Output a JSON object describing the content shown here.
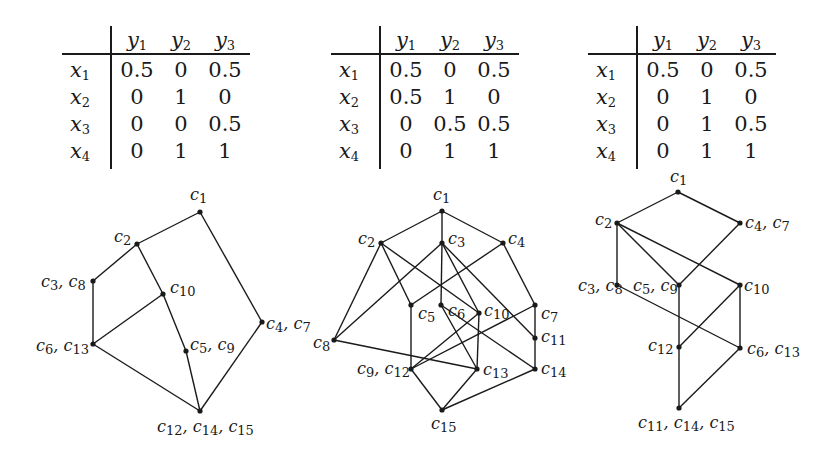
{
  "tables": [
    {
      "columns": [
        "y1",
        "y2",
        "y3"
      ],
      "rows": [
        {
          "label": "x1",
          "values": [
            "0.5",
            "0",
            "0.5"
          ]
        },
        {
          "label": "x2",
          "values": [
            "0",
            "1",
            "0"
          ]
        },
        {
          "label": "x3",
          "values": [
            "0",
            "0",
            "0.5"
          ]
        },
        {
          "label": "x4",
          "values": [
            "0",
            "1",
            "1"
          ]
        }
      ]
    },
    {
      "columns": [
        "y1",
        "y2",
        "y3"
      ],
      "rows": [
        {
          "label": "x1",
          "values": [
            "0.5",
            "0",
            "0.5"
          ]
        },
        {
          "label": "x2",
          "values": [
            "0.5",
            "1",
            "0"
          ]
        },
        {
          "label": "x3",
          "values": [
            "0",
            "0.5",
            "0.5"
          ]
        },
        {
          "label": "x4",
          "values": [
            "0",
            "1",
            "1"
          ]
        }
      ]
    },
    {
      "columns": [
        "y1",
        "y2",
        "y3"
      ],
      "rows": [
        {
          "label": "x1",
          "values": [
            "0.5",
            "0",
            "0.5"
          ]
        },
        {
          "label": "x2",
          "values": [
            "0",
            "1",
            "0"
          ]
        },
        {
          "label": "x3",
          "values": [
            "0",
            "1",
            "0.5"
          ]
        },
        {
          "label": "x4",
          "values": [
            "0",
            "1",
            "1"
          ]
        }
      ]
    }
  ],
  "graphs": [
    {
      "nodes": [
        {
          "id": "c1",
          "label": "c1",
          "x": 200,
          "y": 212
        },
        {
          "id": "c2",
          "label": "c2",
          "x": 137,
          "y": 244
        },
        {
          "id": "c3c8",
          "label": "c3, c8",
          "x": 93,
          "y": 281
        },
        {
          "id": "c10",
          "label": "c10",
          "x": 163,
          "y": 294
        },
        {
          "id": "c4c7",
          "label": "c4, c7",
          "x": 262,
          "y": 322
        },
        {
          "id": "c6c13",
          "label": "c6, c13",
          "x": 93,
          "y": 344
        },
        {
          "id": "c5c9",
          "label": "c5, c9",
          "x": 186,
          "y": 351
        },
        {
          "id": "c12c14c15",
          "label": "c12, c14, c15",
          "x": 200,
          "y": 411
        }
      ],
      "edges": [
        [
          "c1",
          "c2"
        ],
        [
          "c1",
          "c4c7"
        ],
        [
          "c2",
          "c3c8"
        ],
        [
          "c2",
          "c10"
        ],
        [
          "c3c8",
          "c6c13"
        ],
        [
          "c6c13",
          "c10"
        ],
        [
          "c10",
          "c5c9"
        ],
        [
          "c5c9",
          "c12c14c15"
        ],
        [
          "c6c13",
          "c12c14c15"
        ],
        [
          "c4c7",
          "c12c14c15"
        ]
      ]
    },
    {
      "nodes": [
        {
          "id": "c1",
          "label": "c1",
          "x": 442,
          "y": 211
        },
        {
          "id": "c2",
          "label": "c2",
          "x": 381,
          "y": 243
        },
        {
          "id": "c3",
          "label": "c3",
          "x": 442,
          "y": 243
        },
        {
          "id": "c4",
          "label": "c4",
          "x": 503,
          "y": 243
        },
        {
          "id": "c5",
          "label": "c5",
          "x": 411,
          "y": 305
        },
        {
          "id": "c6",
          "label": "c6",
          "x": 441,
          "y": 305
        },
        {
          "id": "c10",
          "label": "c10",
          "x": 479,
          "y": 313
        },
        {
          "id": "c7",
          "label": "c7",
          "x": 535,
          "y": 305
        },
        {
          "id": "c8",
          "label": "c8",
          "x": 334,
          "y": 340
        },
        {
          "id": "c11",
          "label": "c11",
          "x": 535,
          "y": 338
        },
        {
          "id": "c9c12",
          "label": "c9, c12",
          "x": 411,
          "y": 369
        },
        {
          "id": "c13",
          "label": "c13",
          "x": 477,
          "y": 369
        },
        {
          "id": "c14",
          "label": "c14",
          "x": 535,
          "y": 369
        },
        {
          "id": "c15",
          "label": "c15",
          "x": 442,
          "y": 410
        }
      ],
      "edges": [
        [
          "c1",
          "c2"
        ],
        [
          "c1",
          "c3"
        ],
        [
          "c1",
          "c4"
        ],
        [
          "c2",
          "c8"
        ],
        [
          "c2",
          "c5"
        ],
        [
          "c2",
          "c10"
        ],
        [
          "c3",
          "c8"
        ],
        [
          "c3",
          "c6"
        ],
        [
          "c3",
          "c10"
        ],
        [
          "c3",
          "c11"
        ],
        [
          "c4",
          "c5"
        ],
        [
          "c4",
          "c7"
        ],
        [
          "c5",
          "c9c12"
        ],
        [
          "c6",
          "c13"
        ],
        [
          "c6",
          "c14"
        ],
        [
          "c10",
          "c9c12"
        ],
        [
          "c10",
          "c13"
        ],
        [
          "c7",
          "c9c12"
        ],
        [
          "c7",
          "c11"
        ],
        [
          "c11",
          "c14"
        ],
        [
          "c8",
          "c13"
        ],
        [
          "c9c12",
          "c15"
        ],
        [
          "c13",
          "c15"
        ],
        [
          "c14",
          "c15"
        ]
      ]
    },
    {
      "nodes": [
        {
          "id": "c1",
          "label": "c1",
          "x": 678,
          "y": 192
        },
        {
          "id": "c2",
          "label": "c2",
          "x": 617,
          "y": 223
        },
        {
          "id": "c4c7",
          "label": "c4, c7",
          "x": 740,
          "y": 223
        },
        {
          "id": "c3c8",
          "label": "c3, c8",
          "x": 617,
          "y": 285
        },
        {
          "id": "c5c9",
          "label": "c5, c9",
          "x": 679,
          "y": 285
        },
        {
          "id": "c10",
          "label": "c10",
          "x": 740,
          "y": 285
        },
        {
          "id": "c12",
          "label": "c12",
          "x": 679,
          "y": 347
        },
        {
          "id": "c6c13",
          "label": "c6, c13",
          "x": 740,
          "y": 348
        },
        {
          "id": "c11c14c15",
          "label": "c11, c14, c15",
          "x": 679,
          "y": 408
        }
      ],
      "edges": [
        [
          "c1",
          "c2"
        ],
        [
          "c1",
          "c4c7"
        ],
        [
          "c2",
          "c3c8"
        ],
        [
          "c2",
          "c5c9"
        ],
        [
          "c2",
          "c10"
        ],
        [
          "c4c7",
          "c5c9"
        ],
        [
          "c3c8",
          "c6c13"
        ],
        [
          "c5c9",
          "c12"
        ],
        [
          "c10",
          "c12"
        ],
        [
          "c10",
          "c6c13"
        ],
        [
          "c12",
          "c11c14c15"
        ],
        [
          "c6c13",
          "c11c14c15"
        ]
      ]
    }
  ],
  "labels": [
    {
      "graph": 0,
      "text": "c1",
      "x": 190,
      "y": 186
    },
    {
      "graph": 0,
      "text": "c2",
      "x": 114,
      "y": 228
    },
    {
      "graph": 0,
      "text": "c3, c8",
      "x": 41,
      "y": 273
    },
    {
      "graph": 0,
      "text": "c10",
      "x": 170,
      "y": 279
    },
    {
      "graph": 0,
      "text": "c4, c7",
      "x": 266,
      "y": 315
    },
    {
      "graph": 0,
      "text": "c6, c13",
      "x": 36,
      "y": 337
    },
    {
      "graph": 0,
      "text": "c5, c9",
      "x": 190,
      "y": 336
    },
    {
      "graph": 0,
      "text": "c12, c14, c15",
      "x": 157,
      "y": 418
    },
    {
      "graph": 1,
      "text": "c1",
      "x": 433,
      "y": 186
    },
    {
      "graph": 1,
      "text": "c2",
      "x": 358,
      "y": 230
    },
    {
      "graph": 1,
      "text": "c3",
      "x": 448,
      "y": 230
    },
    {
      "graph": 1,
      "text": "c4",
      "x": 508,
      "y": 230
    },
    {
      "graph": 1,
      "text": "c5",
      "x": 418,
      "y": 305
    },
    {
      "graph": 1,
      "text": "c6",
      "x": 448,
      "y": 302
    },
    {
      "graph": 1,
      "text": "c10",
      "x": 484,
      "y": 302
    },
    {
      "graph": 1,
      "text": "c7",
      "x": 541,
      "y": 305
    },
    {
      "graph": 1,
      "text": "c8",
      "x": 313,
      "y": 334
    },
    {
      "graph": 1,
      "text": "c11",
      "x": 541,
      "y": 328
    },
    {
      "graph": 1,
      "text": "c9, c12",
      "x": 357,
      "y": 360
    },
    {
      "graph": 1,
      "text": "c13",
      "x": 483,
      "y": 361
    },
    {
      "graph": 1,
      "text": "c14",
      "x": 541,
      "y": 360
    },
    {
      "graph": 1,
      "text": "c15",
      "x": 431,
      "y": 415
    },
    {
      "graph": 2,
      "text": "c1",
      "x": 670,
      "y": 168
    },
    {
      "graph": 2,
      "text": "c2",
      "x": 595,
      "y": 211
    },
    {
      "graph": 2,
      "text": "c4, c7",
      "x": 745,
      "y": 214
    },
    {
      "graph": 2,
      "text": "c3, c8",
      "x": 578,
      "y": 277
    },
    {
      "graph": 2,
      "text": "c5, c9",
      "x": 633,
      "y": 277
    },
    {
      "graph": 2,
      "text": "c10",
      "x": 744,
      "y": 277
    },
    {
      "graph": 2,
      "text": "c12",
      "x": 648,
      "y": 337
    },
    {
      "graph": 2,
      "text": "c6, c13",
      "x": 747,
      "y": 340
    },
    {
      "graph": 2,
      "text": "c11, c14, c15",
      "x": 638,
      "y": 414
    }
  ],
  "layout": {
    "table_origins": [
      {
        "x": 62,
        "y": 26
      },
      {
        "x": 331,
        "y": 26
      },
      {
        "x": 588,
        "y": 26
      }
    ],
    "colors": {
      "ink": "#1a1a1a",
      "background": "#ffffff"
    }
  }
}
